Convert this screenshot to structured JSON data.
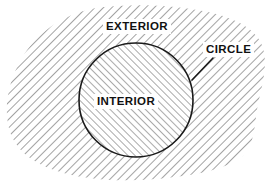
{
  "figure": {
    "kind": "geometry-diagram",
    "background_color": "#ffffff",
    "ink_color": "#1a1a1a",
    "hatch_color": "#555555",
    "labels": {
      "exterior": "EXTERIOR",
      "interior": "INTERIOR",
      "circle": "CIRCLE"
    },
    "shapes": {
      "circle": {
        "name": "circle-outline",
        "center_x": 136,
        "center_y": 100,
        "radius": 57,
        "stroke_width": 1.6,
        "hatch_direction": "forward-slash",
        "hatch_spacing": 5
      },
      "blob": {
        "name": "exterior-region",
        "description": "irregular rounded region surrounding the circle",
        "hatch_direction": "back-slash",
        "hatch_spacing": 6,
        "outline": "none"
      },
      "leader": {
        "name": "circle-leader-line",
        "from_x": 213,
        "from_y": 58,
        "to_x": 192,
        "to_y": 80,
        "stroke_width": 1.6
      }
    }
  }
}
